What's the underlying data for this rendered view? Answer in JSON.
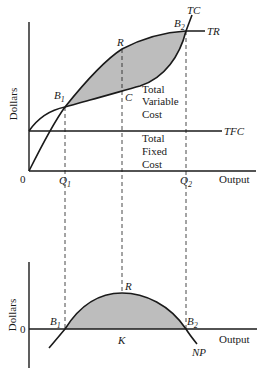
{
  "top_panel": {
    "y_axis_label": "Dollars",
    "x_axis_label": "Output",
    "origin_label": "0",
    "curves": {
      "tc": "TC",
      "tr": "TR",
      "tfc": "TFC"
    },
    "points": {
      "b1": "B",
      "b1_sub": "1",
      "b2": "B",
      "b2_sub": "2",
      "r": "R",
      "c": "C"
    },
    "ticks": {
      "q1": "Q",
      "q1_sub": "1",
      "q2": "Q",
      "q2_sub": "2"
    },
    "regions": {
      "variable_cost": [
        "Total",
        "Variable",
        "Cost"
      ],
      "fixed_cost": [
        "Total",
        "Fixed",
        "Cost"
      ]
    },
    "shading_color": "#bdbdbd"
  },
  "bottom_panel": {
    "y_axis_label": "Dollars",
    "x_axis_label": "Output",
    "zero_label": "0",
    "curves": {
      "np": "NP"
    },
    "points": {
      "b1": "B",
      "b1_sub": "1",
      "b2": "B",
      "b2_sub": "2",
      "r": "R",
      "k": "K"
    },
    "shading_color": "#bdbdbd"
  }
}
